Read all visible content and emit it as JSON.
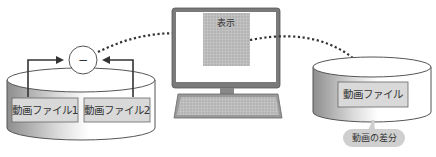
{
  "diagram": {
    "left_storage": {
      "files": [
        {
          "label": "動画ファイル1"
        },
        {
          "label": "動画ファイル2"
        }
      ]
    },
    "operator": {
      "symbol": "−",
      "meaning": "subtraction"
    },
    "display": {
      "label": "表示"
    },
    "right_storage": {
      "file": {
        "label": "動画ファイル"
      },
      "callout": {
        "label": "動画の差分"
      }
    },
    "colors": {
      "cylinder_edge": "#555555",
      "cylinder_dark": "#9a9a9a",
      "file_box": "#d9d9d9",
      "screen_grid": "#a8a8a8",
      "callout": "#cfcfcf",
      "arrow": "#333333"
    }
  }
}
